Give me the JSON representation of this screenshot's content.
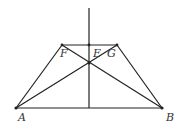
{
  "diagram": {
    "type": "geometry",
    "colors": {
      "stroke": "#222222",
      "label": "#333333",
      "background": "#ffffff"
    },
    "points": {
      "A": {
        "label": "A",
        "x": 16,
        "y": 108
      },
      "B": {
        "label": "B",
        "x": 162,
        "y": 108
      },
      "F": {
        "label": "F",
        "x": 62,
        "y": 45
      },
      "G": {
        "label": "G",
        "x": 117,
        "y": 45
      },
      "E": {
        "label": "E",
        "x": 89,
        "y": 45
      },
      "O": {
        "label": "",
        "x": 89,
        "y": 63
      }
    },
    "segments": [
      [
        "A",
        "B"
      ],
      [
        "F",
        "G"
      ],
      [
        "A",
        "F"
      ],
      [
        "B",
        "G"
      ],
      [
        "A",
        "G"
      ],
      [
        "B",
        "F"
      ]
    ],
    "axis": {
      "x": 89,
      "y1": 8,
      "y2": 108
    }
  }
}
